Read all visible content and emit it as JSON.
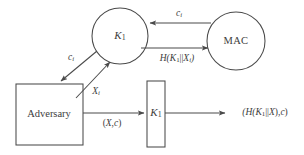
{
  "diagram": {
    "background_color": "#ffffff",
    "stroke_color": "#4a4a4a",
    "text_color": "#3d3d3d",
    "nodes": [
      {
        "id": "key-circle-top",
        "shape": "circle",
        "label_plain": "K1",
        "label_base": "K",
        "label_sub": "1",
        "cx": 120,
        "cy": 36,
        "r": 28
      },
      {
        "id": "mac-circle",
        "shape": "circle",
        "label_plain": "MAC",
        "label_base": "MAC",
        "label_sub": "",
        "cx": 236,
        "cy": 41,
        "r": 29
      },
      {
        "id": "adversary-box",
        "shape": "rect",
        "label_plain": "Adversary",
        "label_base": "Adversary",
        "label_sub": "",
        "x": 16,
        "y": 84,
        "w": 67,
        "h": 61
      },
      {
        "id": "key-rect-bottom",
        "shape": "rect",
        "label_plain": "K1",
        "label_base": "K",
        "label_sub": "1",
        "x": 147,
        "y": 81,
        "w": 18,
        "h": 66
      }
    ],
    "edges": [
      {
        "id": "edge-mac-to-key",
        "from": "mac-circle",
        "to": "key-circle-top",
        "direction": "left",
        "label_plain": "ci",
        "label_base": "c",
        "label_sub": "i"
      },
      {
        "id": "edge-key-to-mac",
        "from": "key-circle-top",
        "to": "mac-circle",
        "direction": "right",
        "label_plain": "H(K1||Xi)",
        "label_parts": [
          "H(",
          "K",
          "1",
          "||",
          "X",
          "i",
          ")"
        ]
      },
      {
        "id": "edge-key-to-adversary",
        "from": "key-circle-top",
        "to": "adversary-box",
        "direction": "down-left",
        "label_plain": "ci",
        "label_base": "c",
        "label_sub": "i"
      },
      {
        "id": "edge-adversary-to-key",
        "from": "adversary-box",
        "to": "key-circle-top",
        "direction": "up-right",
        "label_plain": "Xi",
        "label_base": "X",
        "label_sub": "i"
      },
      {
        "id": "edge-adversary-to-keyrect",
        "from": "adversary-box",
        "to": "key-rect-bottom",
        "direction": "right",
        "label_plain": "(X,c)",
        "label_parts": [
          "(",
          "X",
          ",",
          "c",
          ")"
        ]
      },
      {
        "id": "edge-keyrect-output",
        "from": "key-rect-bottom",
        "to": "output",
        "direction": "right",
        "label_plain": "(H(K1||X),c)",
        "label_parts": [
          "(H(",
          "K",
          "1",
          "||",
          "X",
          "),",
          "c",
          ")"
        ]
      }
    ]
  },
  "labels": {
    "key_circle_top": {
      "base": "K",
      "sub": "1"
    },
    "mac_circle": {
      "text": "MAC"
    },
    "adversary_box": {
      "text": "Adversary"
    },
    "key_rect_bottom": {
      "base": "K",
      "sub": "1"
    },
    "edge_ci_top": {
      "base": "c",
      "sub": "i"
    },
    "edge_hash_top": {
      "h": "H(",
      "k": "K",
      "k_sub": "1",
      "bars": "||",
      "x": "X",
      "x_sub": "i",
      "close": ")"
    },
    "edge_ci_diagonal": {
      "base": "c",
      "sub": "i"
    },
    "edge_xi_diagonal": {
      "base": "X",
      "sub": "i"
    },
    "edge_xc": {
      "open": "(",
      "x": "X",
      "comma": ",",
      "c": "c",
      "close": ")"
    },
    "edge_output": {
      "open": "(H(",
      "k": "K",
      "k_sub": "1",
      "bars": "||",
      "x": "X",
      "mid": "),",
      "c": "c",
      "close": ")"
    }
  }
}
